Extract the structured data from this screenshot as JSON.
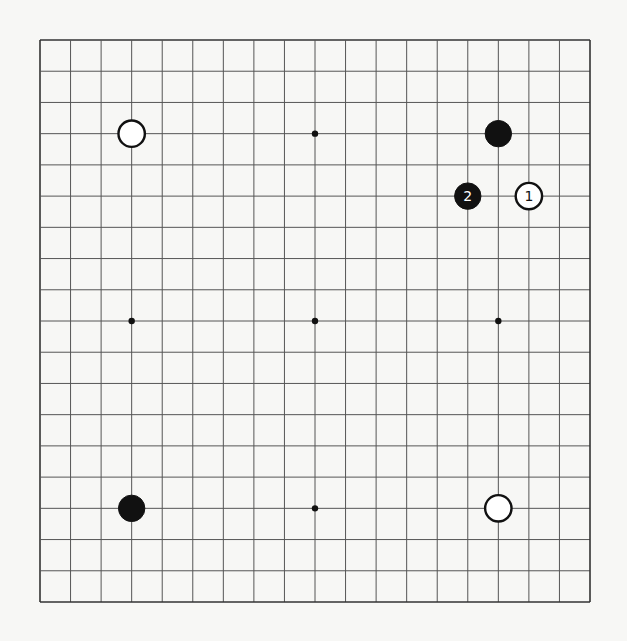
{
  "board": {
    "size": 19,
    "origin": {
      "x": 40,
      "y": 40
    },
    "end": {
      "x": 590,
      "y": 602
    },
    "line_color": "#555555",
    "border_color": "#333333",
    "background": "#f7f7f5",
    "star_points": [
      [
        3,
        3
      ],
      [
        9,
        3
      ],
      [
        15,
        3
      ],
      [
        3,
        9
      ],
      [
        9,
        9
      ],
      [
        15,
        9
      ],
      [
        3,
        15
      ],
      [
        9,
        15
      ],
      [
        15,
        15
      ]
    ],
    "stones": [
      {
        "col": 3,
        "row": 3,
        "color": "white",
        "label": ""
      },
      {
        "col": 15,
        "row": 3,
        "color": "black",
        "label": ""
      },
      {
        "col": 14,
        "row": 5,
        "color": "black",
        "label": "2"
      },
      {
        "col": 16,
        "row": 5,
        "color": "white",
        "label": "1"
      },
      {
        "col": 3,
        "row": 15,
        "color": "black",
        "label": ""
      },
      {
        "col": 15,
        "row": 15,
        "color": "white",
        "label": ""
      }
    ]
  }
}
